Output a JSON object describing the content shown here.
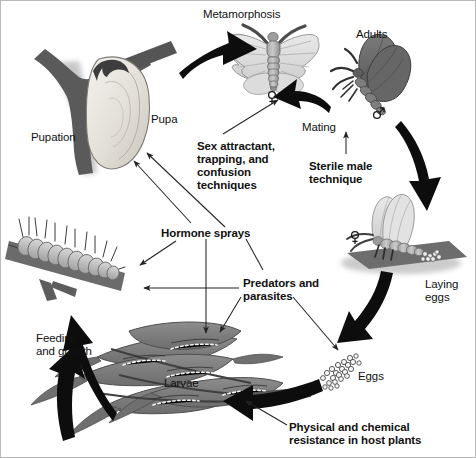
{
  "figure": {
    "type": "cycle-diagram",
    "background": "#ffffff",
    "border_color": "#b9b9b9",
    "width": 476,
    "height": 458
  },
  "palette": {
    "ink": "#111111",
    "arrow_black": "#0d0d0d",
    "thin_arrow": "#2b2b2b",
    "dark_grey": "#5f5f5f",
    "mid_grey": "#8a8a8a",
    "light_grey": "#cfcfcf",
    "pale": "#ececec",
    "branch": "#5a5a5a",
    "shadow": "#bcbcbc"
  },
  "stage_labels": [
    {
      "id": "metamorphosis",
      "text": "Metamorphosis",
      "style": "plain",
      "x": 202,
      "y": 7,
      "align": "left"
    },
    {
      "id": "adults",
      "text": "Adults",
      "style": "plain",
      "x": 355,
      "y": 27,
      "align": "left"
    },
    {
      "id": "mating",
      "text": "Mating",
      "style": "plain",
      "x": 301,
      "y": 120,
      "align": "left"
    },
    {
      "id": "pupa",
      "text": "Pupa",
      "style": "plain",
      "x": 150,
      "y": 112,
      "align": "left"
    },
    {
      "id": "pupation",
      "text": "Pupation",
      "style": "plain",
      "x": 30,
      "y": 130,
      "align": "left"
    },
    {
      "id": "laying-eggs",
      "text": "Laying\neggs",
      "style": "plain",
      "x": 424,
      "y": 277,
      "align": "left"
    },
    {
      "id": "eggs",
      "text": "Eggs",
      "style": "plain",
      "x": 357,
      "y": 369,
      "align": "left"
    },
    {
      "id": "larvae",
      "text": "Larvae",
      "style": "plain",
      "x": 163,
      "y": 376,
      "align": "left"
    },
    {
      "id": "feeding-growth",
      "text": "Feeding\nand growth",
      "style": "plain",
      "x": 35,
      "y": 331,
      "align": "left"
    }
  ],
  "control_labels": [
    {
      "id": "sex-attractant",
      "text": "Sex attractant,\ntrapping, and\nconfusion\ntechniques",
      "style": "bold",
      "x": 196,
      "y": 139
    },
    {
      "id": "sterile-male",
      "text": "Sterile male\ntechnique",
      "style": "bold",
      "x": 308,
      "y": 159
    },
    {
      "id": "hormone-sprays",
      "text": "Hormone sprays",
      "style": "bold",
      "x": 160,
      "y": 226
    },
    {
      "id": "predators-parasites",
      "text": "Predators and\nparasites",
      "style": "bold",
      "x": 242,
      "y": 276
    },
    {
      "id": "host-plant-resistance",
      "text": "Physical and chemical\nresistance in host plants",
      "style": "bold",
      "x": 288,
      "y": 420
    }
  ],
  "sex_symbols": [
    {
      "id": "female-moth-symbol",
      "symbol": "female",
      "x": 271,
      "y": 96
    },
    {
      "id": "male-moth-symbol",
      "symbol": "male",
      "x": 377,
      "y": 111
    },
    {
      "id": "female-laying-symbol",
      "symbol": "female",
      "x": 354,
      "y": 236
    }
  ],
  "cycle_arrows": [
    {
      "id": "pupa-to-adult",
      "from": "pupa",
      "to": "adults",
      "kind": "thick-black"
    },
    {
      "id": "adult-to-mating",
      "from": "male",
      "to": "female",
      "kind": "thick-black"
    },
    {
      "id": "adult-to-laying",
      "from": "adults",
      "to": "laying-eggs",
      "kind": "thick-black"
    },
    {
      "id": "laying-to-eggs",
      "from": "laying-eggs",
      "to": "eggs",
      "kind": "thick-black"
    },
    {
      "id": "eggs-to-larvae",
      "from": "eggs",
      "to": "larvae",
      "kind": "thick-black"
    },
    {
      "id": "larvae-to-feeding",
      "from": "larvae",
      "to": "feeding",
      "kind": "thick-black"
    },
    {
      "id": "feeding-to-pupation",
      "from": "feeding",
      "to": "pupation",
      "kind": "thick-black"
    }
  ],
  "control_arrows": [
    {
      "id": "sex-attractant-to-female",
      "from": "sex-attractant",
      "to": "female-moth"
    },
    {
      "id": "sterile-male-to-mating",
      "from": "sterile-male",
      "to": "mating"
    },
    {
      "id": "hormone-to-pupa-1",
      "from": "hormone-sprays",
      "to": "pupa"
    },
    {
      "id": "hormone-to-pupa-2",
      "from": "hormone-sprays",
      "to": "pupa"
    },
    {
      "id": "hormone-to-caterpillar",
      "from": "hormone-sprays",
      "to": "feeding-caterpillar"
    },
    {
      "id": "hormone-to-larvae",
      "from": "hormone-sprays",
      "to": "larvae"
    },
    {
      "id": "predators-to-caterpillar",
      "from": "predators-parasites",
      "to": "feeding-caterpillar"
    },
    {
      "id": "predators-to-larvae",
      "from": "predators-parasites",
      "to": "larvae"
    },
    {
      "id": "predators-to-eggs",
      "from": "predators-parasites",
      "to": "eggs"
    },
    {
      "id": "resistance-to-larvae",
      "from": "host-plant-resistance",
      "to": "larvae"
    }
  ]
}
